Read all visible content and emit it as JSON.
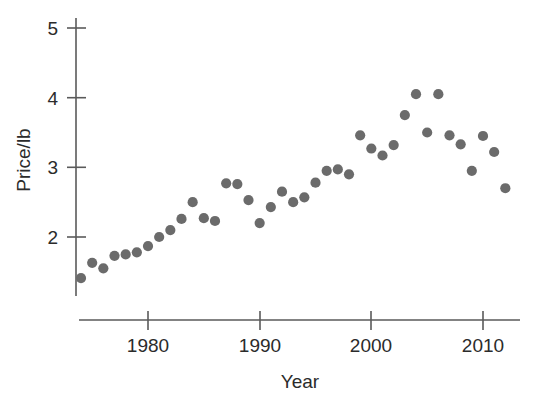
{
  "chart_data": {
    "type": "scatter",
    "title": "",
    "xlabel": "Year",
    "ylabel": "Price/lb",
    "xlim": [
      1973,
      2013.5
    ],
    "ylim": [
      1.25,
      5.3
    ],
    "grid": false,
    "legend": null,
    "xticks": [
      1980,
      1990,
      2000,
      2010
    ],
    "xtick_labels": [
      "1980",
      "1990",
      "2000",
      "2010"
    ],
    "yticks": [
      2,
      3,
      4,
      5
    ],
    "ytick_labels": [
      "2",
      "3",
      "4",
      "5"
    ],
    "marker": {
      "shape": "circle",
      "color": "#6b6b6b",
      "size": 9
    },
    "series": [
      {
        "name": "Price per pound",
        "x": [
          1974,
          1975,
          1976,
          1977,
          1978,
          1979,
          1980,
          1981,
          1982,
          1983,
          1984,
          1985,
          1986,
          1987,
          1988,
          1989,
          1990,
          1991,
          1992,
          1993,
          1994,
          1995,
          1996,
          1997,
          1998,
          1999,
          2000,
          2001,
          2002,
          2003,
          2004,
          2005,
          2006,
          2007,
          2008,
          2009,
          2010,
          2011,
          2012
        ],
        "y": [
          1.41,
          1.63,
          1.55,
          1.73,
          1.75,
          1.78,
          1.87,
          2.0,
          2.1,
          2.26,
          2.5,
          2.27,
          2.23,
          2.77,
          2.76,
          2.53,
          2.2,
          2.43,
          2.65,
          2.5,
          2.57,
          2.78,
          2.95,
          2.97,
          2.9,
          3.46,
          3.27,
          3.17,
          3.32,
          3.75,
          4.05,
          3.5,
          4.05,
          3.46,
          3.33,
          2.95,
          3.45,
          3.22,
          2.7
        ]
      }
    ]
  },
  "axes": {
    "y_label": "Price/lb",
    "x_label": "Year"
  }
}
